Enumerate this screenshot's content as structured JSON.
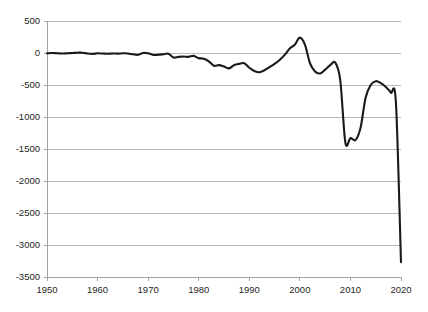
{
  "chart_data": {
    "type": "line",
    "title": "",
    "subtitle": "",
    "xlabel": "",
    "ylabel": "",
    "xlim": [
      1950,
      2020
    ],
    "ylim": [
      -3500,
      500
    ],
    "grid": true,
    "legend": "none",
    "y_ticks": [
      500,
      0,
      -500,
      -1000,
      -1500,
      -2000,
      -2500,
      -3000,
      -3500
    ],
    "y_tick_labels": [
      "500",
      "0",
      "-500",
      "-1000",
      "-1500",
      "-2000",
      "-2500",
      "-3000",
      "-3500"
    ],
    "x_ticks": [
      1950,
      1960,
      1970,
      1980,
      1990,
      2000,
      2010,
      2020
    ],
    "x_tick_labels": [
      "1950",
      "1960",
      "1970",
      "1980",
      "1990",
      "2000",
      "2010",
      "2020"
    ],
    "series": [
      {
        "name": "series-1",
        "color": "#1a1a1a",
        "x": [
          1950,
          1951,
          1952,
          1953,
          1954,
          1955,
          1956,
          1957,
          1958,
          1959,
          1960,
          1961,
          1962,
          1963,
          1964,
          1965,
          1966,
          1967,
          1968,
          1969,
          1970,
          1971,
          1972,
          1973,
          1974,
          1975,
          1976,
          1977,
          1978,
          1979,
          1980,
          1981,
          1982,
          1983,
          1984,
          1985,
          1986,
          1987,
          1988,
          1989,
          1990,
          1991,
          1992,
          1993,
          1994,
          1995,
          1996,
          1997,
          1998,
          1999,
          2000,
          2001,
          2002,
          2003,
          2004,
          2005,
          2006,
          2007,
          2008,
          2009,
          2010,
          2011,
          2012,
          2013,
          2014,
          2015,
          2016,
          2017,
          2018,
          2019,
          2020
        ],
        "values": [
          -5,
          0,
          -4,
          -8,
          -5,
          0,
          5,
          5,
          -8,
          -14,
          -5,
          -8,
          -12,
          -7,
          -10,
          -5,
          -8,
          -20,
          -28,
          0,
          -5,
          -30,
          -28,
          -20,
          -10,
          -70,
          -60,
          -55,
          -60,
          -45,
          -80,
          -90,
          -130,
          -200,
          -190,
          -210,
          -240,
          -190,
          -170,
          -160,
          -230,
          -280,
          -300,
          -270,
          -220,
          -170,
          -110,
          -30,
          70,
          130,
          240,
          130,
          -160,
          -290,
          -320,
          -260,
          -190,
          -150,
          -430,
          -1400,
          -1330,
          -1360,
          -1170,
          -700,
          -500,
          -440,
          -470,
          -530,
          -620,
          -780,
          -3270
        ]
      }
    ]
  },
  "axes": {
    "y_axis_name": "y-axis",
    "x_axis_name": "x-axis"
  }
}
